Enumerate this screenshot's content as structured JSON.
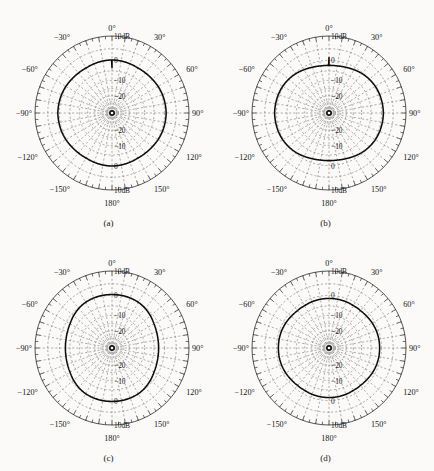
{
  "figure": {
    "ghost_header": "·· ···· ····",
    "background_color": "#fbfaf9",
    "line_color": "#0d0d0d",
    "grid_color": "#6b6b6b",
    "axis_color": "#2a2a2a"
  },
  "panels": [
    {
      "id": "a",
      "caption": "(a)",
      "angle_labels": [
        "0°",
        "30°",
        "60°",
        "90°",
        "120°",
        "150°",
        "180°",
        "−150°",
        "−120°",
        "−90°",
        "−60°",
        "−30°"
      ],
      "radial_labels_top": [
        "10dB",
        "0",
        "−10",
        "−20"
      ],
      "radial_labels_bottom": [
        "−20",
        "−10",
        "0",
        "10dB"
      ]
    },
    {
      "id": "b",
      "caption": "(b)",
      "angle_labels": [
        "0°",
        "30°",
        "60°",
        "90°",
        "120°",
        "150°",
        "180°",
        "−150°",
        "−120°",
        "−90°",
        "−60°",
        "−30°"
      ],
      "radial_labels_top": [
        "10dB",
        "0",
        "−10",
        "−20"
      ],
      "radial_labels_bottom": [
        "−20",
        "−10",
        "0",
        "10dB"
      ]
    },
    {
      "id": "c",
      "caption": "(c)",
      "angle_labels": [
        "0°",
        "30°",
        "60°",
        "90°",
        "120°",
        "150°",
        "180°",
        "−150°",
        "−120°",
        "−90°",
        "−60°",
        "−30°"
      ],
      "radial_labels_top": [
        "10dB",
        "0",
        "−10",
        "−20"
      ],
      "radial_labels_bottom": [
        "−20",
        "−10",
        "0",
        "10dB"
      ]
    },
    {
      "id": "d",
      "caption": "(d)",
      "angle_labels": [
        "0°",
        "30°",
        "60°",
        "90°",
        "120°",
        "150°",
        "180°",
        "−150°",
        "−120°",
        "−90°",
        "−60°",
        "−30°"
      ],
      "radial_labels_top": [
        "10dB",
        "0",
        "−10",
        "−20"
      ],
      "radial_labels_bottom": [
        "−20",
        "−10",
        "0",
        "10dB"
      ]
    }
  ],
  "chart_data": [
    {
      "type": "line",
      "subtype": "polar-radiation-pattern",
      "title": "(a)",
      "xlabel": "Angle (degrees)",
      "ylabel": "Gain (dB)",
      "rlim": [
        -40,
        10
      ],
      "r_ticks": [
        10,
        0,
        -10,
        -20
      ],
      "r_tick_labels": [
        "10dB",
        "0",
        "−10",
        "−20"
      ],
      "theta_ticks": [
        0,
        30,
        60,
        90,
        120,
        150,
        180,
        -150,
        -120,
        -90,
        -60,
        -30
      ],
      "theta_tick_labels": [
        "0°",
        "30°",
        "60°",
        "90°",
        "120°",
        "150°",
        "180°",
        "−150°",
        "−120°",
        "−90°",
        "−60°",
        "−30°"
      ],
      "grid": true,
      "legend": "none",
      "theta": [
        0,
        10,
        20,
        30,
        40,
        50,
        60,
        70,
        80,
        90,
        100,
        110,
        120,
        130,
        140,
        150,
        160,
        170,
        180,
        190,
        200,
        210,
        220,
        230,
        240,
        250,
        260,
        270,
        280,
        290,
        300,
        310,
        320,
        330,
        340,
        350
      ],
      "r": [
        0.2,
        0.1,
        -0.1,
        -0.3,
        -0.2,
        0.0,
        0.3,
        0.5,
        0.6,
        0.7,
        0.6,
        0.5,
        0.3,
        0.0,
        -0.2,
        -0.3,
        -0.1,
        0.1,
        0.2,
        0.1,
        -0.1,
        -0.3,
        -0.2,
        0.0,
        0.3,
        0.5,
        0.6,
        0.7,
        0.6,
        0.5,
        0.3,
        0.0,
        -0.2,
        -0.3,
        -0.1,
        0.1
      ]
    },
    {
      "type": "line",
      "subtype": "polar-radiation-pattern",
      "title": "(b)",
      "xlabel": "Angle (degrees)",
      "ylabel": "Gain (dB)",
      "rlim": [
        -40,
        10
      ],
      "r_ticks": [
        10,
        0,
        -10,
        -20
      ],
      "r_tick_labels": [
        "10dB",
        "0",
        "−10",
        "−20"
      ],
      "theta_ticks": [
        0,
        30,
        60,
        90,
        120,
        150,
        180,
        -150,
        -120,
        -90,
        -60,
        -30
      ],
      "theta_tick_labels": [
        "0°",
        "30°",
        "60°",
        "90°",
        "120°",
        "150°",
        "180°",
        "−150°",
        "−120°",
        "−90°",
        "−60°",
        "−30°"
      ],
      "grid": true,
      "legend": "none",
      "theta": [
        0,
        10,
        20,
        30,
        40,
        50,
        60,
        70,
        80,
        90,
        100,
        110,
        120,
        130,
        140,
        150,
        160,
        170,
        180,
        190,
        200,
        210,
        220,
        230,
        240,
        250,
        260,
        270,
        280,
        290,
        300,
        310,
        320,
        330,
        340,
        350
      ],
      "r": [
        -2.3,
        -2.2,
        -1.8,
        -1.2,
        -0.5,
        0.0,
        0.4,
        0.6,
        0.7,
        0.8,
        0.7,
        0.6,
        0.4,
        0.0,
        -0.5,
        -1.2,
        -1.8,
        -2.2,
        -2.3,
        -2.2,
        -1.8,
        -1.2,
        -0.5,
        0.0,
        0.4,
        0.6,
        0.7,
        0.8,
        0.7,
        0.6,
        0.4,
        0.0,
        -0.5,
        -1.2,
        -1.8,
        -2.2
      ]
    },
    {
      "type": "line",
      "subtype": "polar-radiation-pattern",
      "title": "(c)",
      "xlabel": "Angle (degrees)",
      "ylabel": "Gain (dB)",
      "rlim": [
        -40,
        10
      ],
      "r_ticks": [
        10,
        0,
        -10,
        -20
      ],
      "r_tick_labels": [
        "10dB",
        "0",
        "−10",
        "−20"
      ],
      "theta_ticks": [
        0,
        30,
        60,
        90,
        120,
        150,
        180,
        -150,
        -120,
        -90,
        -60,
        -30
      ],
      "theta_tick_labels": [
        "0°",
        "30°",
        "60°",
        "90°",
        "120°",
        "150°",
        "180°",
        "−150°",
        "−120°",
        "−90°",
        "−60°",
        "−30°"
      ],
      "grid": true,
      "legend": "none",
      "theta": [
        0,
        10,
        20,
        30,
        40,
        50,
        60,
        70,
        80,
        90,
        100,
        110,
        120,
        130,
        140,
        150,
        160,
        170,
        180,
        190,
        200,
        210,
        220,
        230,
        240,
        250,
        260,
        270,
        280,
        290,
        300,
        310,
        320,
        330,
        340,
        350
      ],
      "r": [
        0.4,
        0.4,
        0.3,
        0.1,
        -0.4,
        -1.1,
        -1.9,
        -2.4,
        -2.7,
        -2.8,
        -2.7,
        -2.4,
        -1.9,
        -1.1,
        -0.4,
        0.1,
        0.3,
        0.4,
        0.4,
        0.4,
        0.3,
        0.1,
        -0.4,
        -1.1,
        -1.9,
        -2.4,
        -2.7,
        -2.8,
        -2.7,
        -2.4,
        -1.9,
        -1.1,
        -0.4,
        0.1,
        0.3,
        0.4
      ]
    },
    {
      "type": "line",
      "subtype": "polar-radiation-pattern",
      "title": "(d)",
      "xlabel": "Angle (degrees)",
      "ylabel": "Gain (dB)",
      "rlim": [
        -40,
        10
      ],
      "r_ticks": [
        10,
        0,
        -10,
        -20
      ],
      "r_tick_labels": [
        "10dB",
        "0",
        "−10",
        "−20"
      ],
      "theta_ticks": [
        0,
        30,
        60,
        90,
        120,
        150,
        180,
        -150,
        -120,
        -90,
        -60,
        -30
      ],
      "theta_tick_labels": [
        "0°",
        "30°",
        "60°",
        "90°",
        "120°",
        "150°",
        "180°",
        "−150°",
        "−120°",
        "−90°",
        "−60°",
        "−30°"
      ],
      "grid": true,
      "legend": "none",
      "theta": [
        0,
        10,
        20,
        30,
        40,
        50,
        60,
        70,
        80,
        90,
        100,
        110,
        120,
        130,
        140,
        150,
        160,
        170,
        180,
        190,
        200,
        210,
        220,
        230,
        240,
        250,
        260,
        270,
        280,
        290,
        300,
        310,
        320,
        330,
        340,
        350
      ],
      "r": [
        -1.4,
        -1.4,
        -1.5,
        -1.7,
        -1.7,
        -1.5,
        -1.2,
        -1.0,
        -0.9,
        -0.9,
        -0.9,
        -1.0,
        -1.2,
        -1.5,
        -1.7,
        -1.7,
        -1.5,
        -1.4,
        -1.4,
        -1.4,
        -1.5,
        -1.7,
        -1.7,
        -1.5,
        -1.2,
        -1.0,
        -0.9,
        -0.9,
        -0.9,
        -1.0,
        -1.2,
        -1.5,
        -1.7,
        -1.7,
        -1.5,
        -1.4
      ]
    }
  ]
}
